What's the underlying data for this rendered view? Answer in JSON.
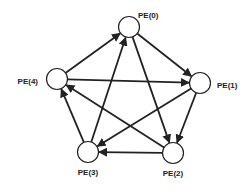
{
  "diagram": {
    "type": "directed-graph",
    "nodes": [
      {
        "id": "PE0",
        "label": "PE(0)",
        "x": 129,
        "y": 27,
        "r": 10.5,
        "lx": 138,
        "ly": 18,
        "anchor": "start"
      },
      {
        "id": "PE1",
        "label": "PE(1)",
        "x": 200,
        "y": 83,
        "r": 10.5,
        "lx": 217,
        "ly": 88,
        "anchor": "start"
      },
      {
        "id": "PE2",
        "label": "PE(2)",
        "x": 173,
        "y": 153,
        "r": 10.5,
        "lx": 173,
        "ly": 176,
        "anchor": "middle"
      },
      {
        "id": "PE3",
        "label": "PE(3)",
        "x": 88,
        "y": 152,
        "r": 10.5,
        "lx": 88,
        "ly": 175,
        "anchor": "middle"
      },
      {
        "id": "PE4",
        "label": "PE(4)",
        "x": 57,
        "y": 79,
        "r": 10.5,
        "lx": 38,
        "ly": 84,
        "anchor": "end"
      }
    ],
    "edges": [
      {
        "from": "PE4",
        "to": "PE0"
      },
      {
        "from": "PE3",
        "to": "PE0"
      },
      {
        "from": "PE0",
        "to": "PE1"
      },
      {
        "from": "PE0",
        "to": "PE2"
      },
      {
        "from": "PE4",
        "to": "PE1"
      },
      {
        "from": "PE1",
        "to": "PE2"
      },
      {
        "from": "PE1",
        "to": "PE3"
      },
      {
        "from": "PE2",
        "to": "PE3"
      },
      {
        "from": "PE2",
        "to": "PE4"
      },
      {
        "from": "PE3",
        "to": "PE4"
      }
    ]
  }
}
